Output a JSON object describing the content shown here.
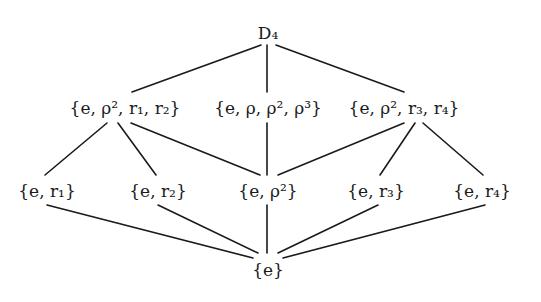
{
  "diagram": {
    "type": "subgroup-lattice",
    "nodes": [
      {
        "id": "D4",
        "label": "D₄",
        "x": 268,
        "y": 33
      },
      {
        "id": "V1",
        "label": "{e, ρ², r₁, r₂}",
        "x": 125,
        "y": 108
      },
      {
        "id": "C4",
        "label": "{e, ρ, ρ², ρ³}",
        "x": 268,
        "y": 108
      },
      {
        "id": "V2",
        "label": "{e, ρ², r₃, r₄}",
        "x": 404,
        "y": 108
      },
      {
        "id": "R1",
        "label": "{e, r₁}",
        "x": 47,
        "y": 191
      },
      {
        "id": "R2",
        "label": "{e, r₂}",
        "x": 158,
        "y": 191
      },
      {
        "id": "Z2",
        "label": "{e, ρ²}",
        "x": 268,
        "y": 191
      },
      {
        "id": "R3",
        "label": "{e, r₃}",
        "x": 376,
        "y": 191
      },
      {
        "id": "R4",
        "label": "{e, r₄}",
        "x": 482,
        "y": 191
      },
      {
        "id": "E",
        "label": "{e}",
        "x": 268,
        "y": 270
      }
    ],
    "edges": [
      {
        "from": "D4",
        "to": "V1",
        "x1": 261,
        "y1": 45,
        "x2": 132,
        "y2": 92
      },
      {
        "from": "D4",
        "to": "C4",
        "x1": 267,
        "y1": 45,
        "x2": 267,
        "y2": 92
      },
      {
        "from": "D4",
        "to": "V2",
        "x1": 276,
        "y1": 45,
        "x2": 404,
        "y2": 92
      },
      {
        "from": "V1",
        "to": "R1",
        "x1": 107,
        "y1": 123,
        "x2": 45,
        "y2": 175
      },
      {
        "from": "V1",
        "to": "R2",
        "x1": 118,
        "y1": 123,
        "x2": 156,
        "y2": 175
      },
      {
        "from": "V1",
        "to": "Z2",
        "x1": 131,
        "y1": 123,
        "x2": 260,
        "y2": 175
      },
      {
        "from": "C4",
        "to": "Z2",
        "x1": 267,
        "y1": 123,
        "x2": 267,
        "y2": 175
      },
      {
        "from": "V2",
        "to": "Z2",
        "x1": 404,
        "y1": 123,
        "x2": 278,
        "y2": 175
      },
      {
        "from": "V2",
        "to": "R3",
        "x1": 415,
        "y1": 123,
        "x2": 380,
        "y2": 175
      },
      {
        "from": "V2",
        "to": "R4",
        "x1": 423,
        "y1": 123,
        "x2": 483,
        "y2": 175
      },
      {
        "from": "R1",
        "to": "E",
        "x1": 47,
        "y1": 205,
        "x2": 253,
        "y2": 258
      },
      {
        "from": "R2",
        "to": "E",
        "x1": 158,
        "y1": 205,
        "x2": 258,
        "y2": 253
      },
      {
        "from": "Z2",
        "to": "E",
        "x1": 267,
        "y1": 205,
        "x2": 267,
        "y2": 253
      },
      {
        "from": "R3",
        "to": "E",
        "x1": 378,
        "y1": 205,
        "x2": 278,
        "y2": 253
      },
      {
        "from": "R4",
        "to": "E",
        "x1": 485,
        "y1": 205,
        "x2": 283,
        "y2": 258
      }
    ],
    "colors": {
      "line": "#1a1a1a",
      "text": "#1a1a1a",
      "background": "#ffffff"
    }
  }
}
